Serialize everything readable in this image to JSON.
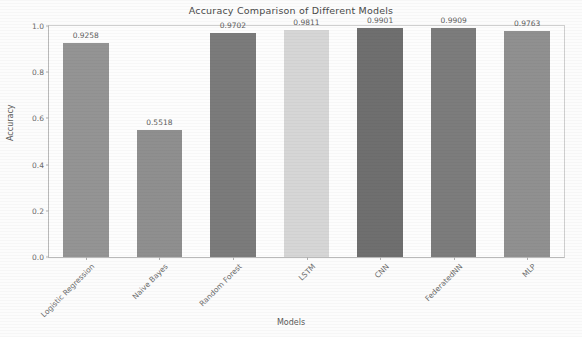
{
  "chart_data": {
    "type": "bar",
    "title": "Accuracy Comparison of Different Models",
    "xlabel": "Models",
    "ylabel": "Accuracy",
    "categories": [
      "Logistic Regression",
      "Naive Bayes",
      "Random Forest",
      "LSTM",
      "CNN",
      "FederatedNN",
      "MLP"
    ],
    "values": [
      0.9258,
      0.5518,
      0.9702,
      0.9811,
      0.9901,
      0.9909,
      0.9763
    ],
    "value_labels": [
      "0.9258",
      "0.5518",
      "0.9702",
      "0.9811",
      "0.9901",
      "0.9909",
      "0.9763"
    ],
    "bar_colors": [
      "#949494",
      "#8f8f8f",
      "#7b7b7b",
      "#d6d6d6",
      "#6f6f6f",
      "#7c7c7c",
      "#909090"
    ],
    "ylim": [
      0.0,
      1.0
    ],
    "ytick_labels": [
      "0.0",
      "0.2",
      "0.4",
      "0.6",
      "0.8",
      "1.0"
    ],
    "ytick_values": [
      0.0,
      0.2,
      0.4,
      0.6,
      0.8,
      1.0
    ],
    "grid": false,
    "legend": "none",
    "xtick_rotation": -45
  }
}
